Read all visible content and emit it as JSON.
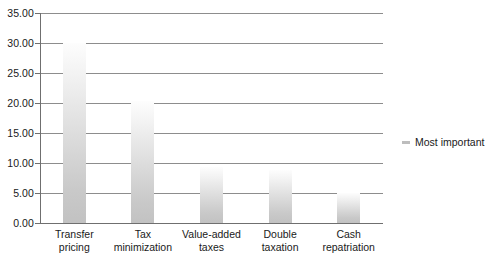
{
  "chart_data": {
    "type": "bar",
    "title": "",
    "subtitle": "",
    "xlabel": "",
    "ylabel": "",
    "categories": [
      "Transfer pricing",
      "Tax minimization",
      "Value-added taxes",
      "Double taxation",
      "Cash repatriation"
    ],
    "category_lines": [
      [
        "Transfer",
        "pricing"
      ],
      [
        "Tax",
        "minimization"
      ],
      [
        "Value-added",
        "taxes"
      ],
      [
        "Double",
        "taxation"
      ],
      [
        "Cash",
        "repatriation"
      ]
    ],
    "series": [
      {
        "name": "Most important",
        "values": [
          30.0,
          20.3,
          9.3,
          8.8,
          5.0
        ]
      }
    ],
    "values": [
      30.0,
      20.3,
      9.3,
      8.8,
      5.0
    ],
    "ylim": [
      0,
      35
    ],
    "ytick_values": [
      0,
      5,
      10,
      15,
      20,
      25,
      30,
      35
    ],
    "ytick_labels": [
      "0.00",
      "5.00",
      "10.00",
      "15.00",
      "20.00",
      "25.00",
      "30.00",
      "35.00"
    ],
    "grid": "horizontal",
    "legend_position": "right",
    "legend": [
      {
        "label": "Most important",
        "marker": "legend-swatch-icon",
        "color": "#bdbdbd"
      }
    ],
    "bar_color_top": "#fdfdfd",
    "bar_color_bottom": "#c2c2c2",
    "gridline_color": "#8d8d8d",
    "axis_color": "#6f6f6f",
    "text_color": "#1a1a1a"
  }
}
